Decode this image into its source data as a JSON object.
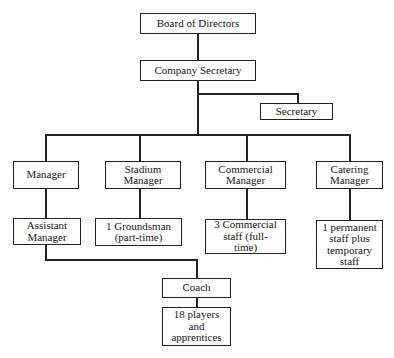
{
  "chart": {
    "nodes": {
      "board": "Board of Directors",
      "company_secretary": "Company Secretary",
      "secretary": "Secretary",
      "manager": "Manager",
      "stadium_manager": "Stadium Manager",
      "commercial_manager": "Commercial Manager",
      "catering_manager": "Catering Manager",
      "assistant_manager": "Assistant Manager",
      "groundsman": "1 Groundsman (part-time)",
      "commercial_staff": "3 Commercial staff (full-time)",
      "catering_staff": "1 permanent staff plus temporary staff",
      "coach": "Coach",
      "players": "18 players and apprentices"
    },
    "edges": [
      [
        "board",
        "company_secretary"
      ],
      [
        "company_secretary",
        "secretary"
      ],
      [
        "company_secretary",
        "manager"
      ],
      [
        "company_secretary",
        "stadium_manager"
      ],
      [
        "company_secretary",
        "commercial_manager"
      ],
      [
        "company_secretary",
        "catering_manager"
      ],
      [
        "manager",
        "assistant_manager"
      ],
      [
        "stadium_manager",
        "groundsman"
      ],
      [
        "commercial_manager",
        "commercial_staff"
      ],
      [
        "catering_manager",
        "catering_staff"
      ],
      [
        "assistant_manager",
        "coach"
      ],
      [
        "coach",
        "players"
      ]
    ]
  }
}
